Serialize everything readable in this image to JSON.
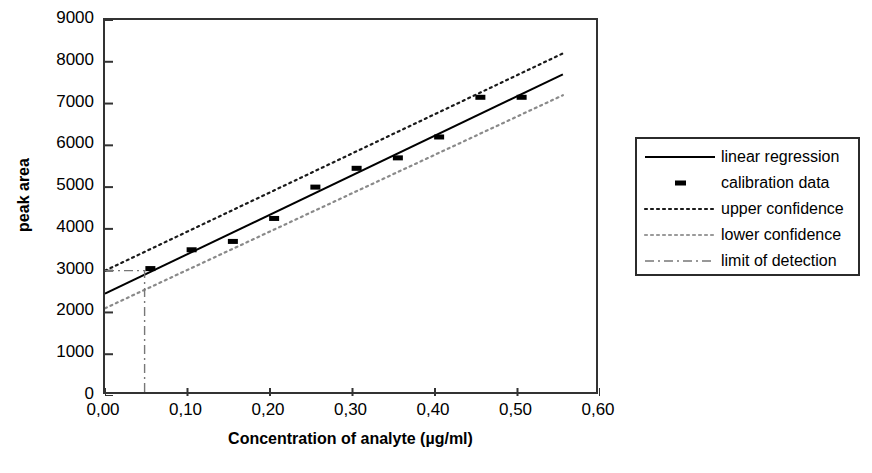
{
  "chart_data": {
    "type": "line",
    "title": "",
    "xlabel": "Concentration of analyte (µg/ml)",
    "ylabel": "peak area",
    "xlim": [
      0.0,
      0.6
    ],
    "ylim": [
      0,
      9000
    ],
    "grid": false,
    "legend_position": "right",
    "x_ticks": [
      "0,00",
      "0,10",
      "0,20",
      "0,30",
      "0,40",
      "0,50",
      "0,60"
    ],
    "x_tick_values": [
      0.0,
      0.1,
      0.2,
      0.3,
      0.4,
      0.5,
      0.6
    ],
    "y_ticks": [
      "0",
      "1000",
      "2000",
      "3000",
      "4000",
      "5000",
      "6000",
      "7000",
      "8000",
      "9000"
    ],
    "y_tick_values": [
      0,
      1000,
      2000,
      3000,
      4000,
      5000,
      6000,
      7000,
      8000,
      9000
    ],
    "series": [
      {
        "name": "linear regression",
        "style": "solid",
        "color": "#000000",
        "x": [
          0.0,
          0.555
        ],
        "values": [
          2450,
          7700
        ]
      },
      {
        "name": "calibration data",
        "style": "markers",
        "color": "#000000",
        "x": [
          0.055,
          0.105,
          0.155,
          0.205,
          0.255,
          0.305,
          0.355,
          0.405,
          0.455,
          0.505
        ],
        "values": [
          3050,
          3500,
          3700,
          4250,
          5000,
          5450,
          5700,
          6200,
          7150,
          7150
        ]
      },
      {
        "name": "upper confidence",
        "style": "dotted",
        "color": "#1a1a1a",
        "x": [
          0.0,
          0.555
        ],
        "values": [
          3000,
          8200
        ]
      },
      {
        "name": "lower confidence",
        "style": "dotted",
        "color": "#8a8a8a",
        "x": [
          0.0,
          0.555
        ],
        "values": [
          2100,
          7200
        ]
      },
      {
        "name": "limit of detection",
        "style": "dashdot",
        "color": "#777777",
        "points": [
          [
            0.0,
            3000
          ],
          [
            0.048,
            3000
          ],
          [
            0.048,
            0
          ]
        ]
      }
    ]
  },
  "legend": {
    "items": [
      {
        "label": "linear regression",
        "key": "solid-line-key"
      },
      {
        "label": "calibration data",
        "key": "marker-key"
      },
      {
        "label": "upper confidence",
        "key": "dotted-dark-key"
      },
      {
        "label": "lower confidence",
        "key": "dotted-light-key"
      },
      {
        "label": "limit of detection",
        "key": "dashdot-key"
      }
    ]
  }
}
